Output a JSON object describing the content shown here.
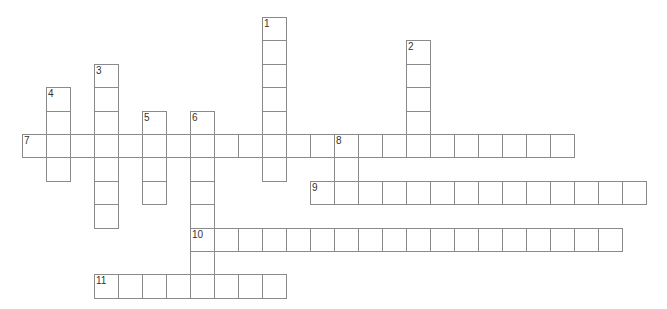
{
  "puzzle": {
    "type": "crossword",
    "cell_size": 24,
    "origin": {
      "x": 22,
      "y": 17
    },
    "row_height": 23.4,
    "border_color": "#8a8a8a",
    "background": "#ffffff",
    "entries": [
      {
        "number": "1",
        "direction": "down",
        "col": 10,
        "row": 0,
        "length": 7
      },
      {
        "number": "2",
        "direction": "down",
        "col": 16,
        "row": 1,
        "length": 5
      },
      {
        "number": "3",
        "direction": "down",
        "col": 3,
        "row": 2,
        "length": 7
      },
      {
        "number": "4",
        "direction": "down",
        "col": 1,
        "row": 3,
        "length": 4
      },
      {
        "number": "5",
        "direction": "down",
        "col": 5,
        "row": 4,
        "length": 4
      },
      {
        "number": "6",
        "direction": "down",
        "col": 7,
        "row": 4,
        "length": 8
      },
      {
        "number": "7",
        "direction": "across",
        "col": 0,
        "row": 5,
        "length": 23
      },
      {
        "number": "8",
        "direction": "down",
        "col": 13,
        "row": 5,
        "length": 3
      },
      {
        "number": "9",
        "direction": "across",
        "col": 12,
        "row": 7,
        "length": 14
      },
      {
        "number": "10",
        "direction": "across",
        "col": 7,
        "row": 9,
        "length": 18
      },
      {
        "number": "11",
        "direction": "across",
        "col": 3,
        "row": 11,
        "length": 8
      }
    ]
  }
}
